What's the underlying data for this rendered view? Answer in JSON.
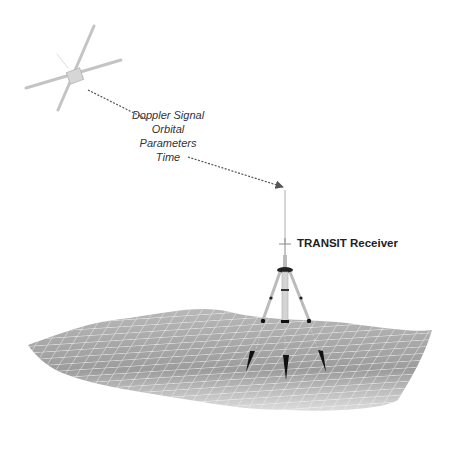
{
  "diagram": {
    "signal_labels": [
      "Doppler Signal",
      "Orbital Parameters",
      "Time"
    ],
    "receiver_label": "TRANSIT Receiver",
    "elements": {
      "satellite": "satellite-icon",
      "signal_path": "dashed-arrow",
      "receiver": "tripod-antenna",
      "terrain": "wireframe-ground-surface",
      "ground_stakes": 3
    },
    "colors": {
      "terrain_fill": "#9a9a9a",
      "terrain_grid": "#f2f2f2",
      "satellite": "#bdbdbd",
      "arrow": "#555555",
      "text": "#222222"
    }
  }
}
